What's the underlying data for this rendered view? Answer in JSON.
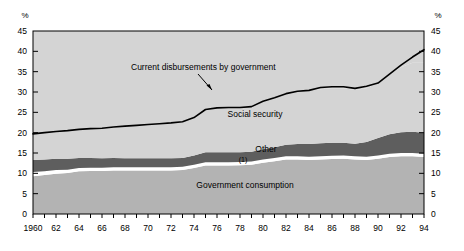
{
  "chart_data": {
    "type": "area",
    "title": "",
    "subtitle": "",
    "xlabel": "",
    "ylabel": "",
    "y_unit": "%",
    "ylim": [
      0,
      45
    ],
    "xlim": [
      1960,
      1994
    ],
    "yticks": [
      0,
      5,
      10,
      15,
      20,
      25,
      30,
      35,
      40,
      45
    ],
    "ytick_labels": [
      "0",
      "5",
      "10",
      "15",
      "20",
      "25",
      "30",
      "35",
      "40",
      "45"
    ],
    "xticks": [
      1960,
      1962,
      1964,
      1966,
      1968,
      1970,
      1972,
      1974,
      1976,
      1978,
      1980,
      1982,
      1984,
      1986,
      1988,
      1990,
      1992,
      1994
    ],
    "xtick_labels": [
      "1960",
      "62",
      "64",
      "66",
      "68",
      "70",
      "72",
      "74",
      "76",
      "78",
      "80",
      "82",
      "84",
      "86",
      "88",
      "90",
      "92",
      "94"
    ],
    "grid": false,
    "legend_position": "inline-annotations",
    "x": [
      1960,
      1961,
      1962,
      1963,
      1964,
      1965,
      1966,
      1967,
      1968,
      1969,
      1970,
      1971,
      1972,
      1973,
      1974,
      1975,
      1976,
      1977,
      1978,
      1979,
      1980,
      1981,
      1982,
      1983,
      1984,
      1985,
      1986,
      1987,
      1988,
      1989,
      1990,
      1991,
      1992,
      1993,
      1994
    ],
    "series": [
      {
        "name": "Government consumption",
        "label": "Government consumption",
        "color": "#b3b3b3",
        "stack_order": 1,
        "values": [
          9.3,
          9.6,
          9.9,
          10.1,
          10.5,
          10.6,
          10.6,
          10.7,
          10.7,
          10.7,
          10.7,
          10.7,
          10.7,
          10.8,
          11.3,
          11.9,
          11.9,
          11.9,
          12.0,
          12.1,
          12.6,
          13.0,
          13.4,
          13.4,
          13.3,
          13.4,
          13.5,
          13.6,
          13.4,
          13.3,
          13.6,
          14.0,
          14.2,
          14.2,
          14.0
        ]
      },
      {
        "name": "Note band",
        "label": "(1)",
        "color": "#ffffff",
        "stack_order": 2,
        "values": [
          1.0,
          0.9,
          0.9,
          0.8,
          0.8,
          0.8,
          0.8,
          0.8,
          0.8,
          0.8,
          0.8,
          0.8,
          0.8,
          0.8,
          0.8,
          0.8,
          0.8,
          0.8,
          0.8,
          0.8,
          0.8,
          0.8,
          0.8,
          0.8,
          0.8,
          0.8,
          0.8,
          0.8,
          0.8,
          0.8,
          0.8,
          0.8,
          0.8,
          0.8,
          0.8
        ]
      },
      {
        "name": "Other",
        "label": "Other",
        "color": "#5e5e5e",
        "stack_order": 3,
        "values": [
          3.0,
          2.9,
          2.8,
          2.7,
          2.5,
          2.4,
          2.3,
          2.3,
          2.2,
          2.2,
          2.2,
          2.2,
          2.2,
          2.2,
          2.3,
          2.5,
          2.5,
          2.5,
          2.4,
          2.4,
          2.5,
          2.6,
          2.8,
          3.0,
          3.1,
          3.2,
          3.2,
          3.1,
          3.1,
          3.6,
          4.3,
          4.8,
          5.1,
          5.2,
          5.2
        ]
      },
      {
        "name": "Social security",
        "label": "Social security",
        "color": "#d4d4d4",
        "stack_order": 4,
        "values": [
          6.4,
          6.6,
          6.7,
          6.9,
          7.0,
          7.2,
          7.4,
          7.6,
          7.9,
          8.1,
          8.3,
          8.5,
          8.7,
          8.9,
          9.3,
          10.5,
          10.9,
          11.0,
          11.0,
          11.1,
          11.8,
          12.2,
          12.6,
          13.0,
          13.2,
          13.3,
          13.4,
          13.4,
          13.2,
          13.2,
          13.5,
          14.8,
          16.0,
          17.0,
          17.2
        ]
      }
    ],
    "line_series": {
      "name": "Current disbursements by government",
      "label": "Current disbursements by government",
      "color": "#000000",
      "values": [
        19.7,
        20.0,
        20.3,
        20.5,
        20.8,
        21.0,
        21.1,
        21.4,
        21.6,
        21.8,
        22.0,
        22.2,
        22.4,
        22.7,
        23.7,
        25.7,
        26.1,
        26.2,
        26.2,
        26.4,
        27.7,
        28.6,
        29.6,
        30.2,
        30.4,
        31.1,
        31.3,
        31.3,
        30.9,
        31.4,
        32.2,
        34.4,
        36.6,
        38.6,
        40.4
      ]
    },
    "annotations": [
      {
        "name": "current-disbursements-annotation",
        "text": "Current disbursements by government",
        "x": 1960,
        "y": 0
      },
      {
        "name": "social-security-annotation",
        "text": "Social security",
        "x": 0,
        "y": 0
      },
      {
        "name": "other-annotation",
        "text": "Other",
        "x": 0,
        "y": 0
      },
      {
        "name": "footnote-marker-annotation",
        "text": "(1)",
        "x": 0,
        "y": 0
      },
      {
        "name": "government-consumption-annotation",
        "text": "Government consumption",
        "x": 0,
        "y": 0
      }
    ],
    "axis_unit_left": "%",
    "axis_unit_right": "%"
  }
}
